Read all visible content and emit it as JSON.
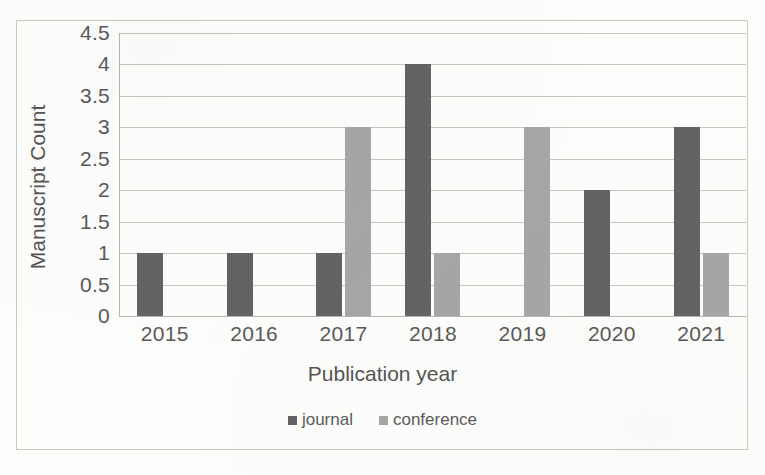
{
  "chart_data": {
    "type": "bar",
    "title": "",
    "xlabel": "Publication year",
    "ylabel": "Manuscript Count",
    "categories": [
      "2015",
      "2016",
      "2017",
      "2018",
      "2019",
      "2020",
      "2021"
    ],
    "series": [
      {
        "name": "journal",
        "color": "#636363",
        "values": [
          1,
          1,
          1,
          4,
          0,
          2,
          3
        ]
      },
      {
        "name": "conference",
        "color": "#a6a6a6",
        "values": [
          0,
          0,
          3,
          1,
          3,
          0,
          1
        ]
      }
    ],
    "ylim": [
      0,
      4.5
    ],
    "ytick_step": 0.5,
    "yticks": [
      "4.5",
      "4",
      "3.5",
      "3",
      "2.5",
      "2",
      "1.5",
      "1",
      "0.5",
      "0"
    ],
    "ytick_values": [
      4.5,
      4,
      3.5,
      3,
      2.5,
      2,
      1.5,
      1,
      0.5,
      0
    ],
    "grid": "horizontal",
    "legend_position": "bottom-center",
    "legend": [
      "journal",
      "conference"
    ],
    "background_color": "#fdfdfb",
    "gridline_color": "#bdbdb8",
    "border_color": "#c9c9c4"
  }
}
